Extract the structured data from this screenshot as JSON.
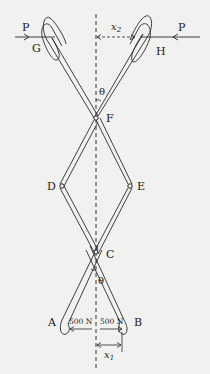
{
  "diagram": {
    "type": "scissor-linkage mechanism",
    "points": {
      "G": "G",
      "H": "H",
      "F": "F",
      "D": "D",
      "E": "E",
      "C": "C",
      "A": "A",
      "B": "B"
    },
    "forces": {
      "left_P": "P",
      "right_P": "P",
      "left_tension": "500 N",
      "right_tension": "500 N"
    },
    "dimensions": {
      "top": "x",
      "top_sub": "2",
      "bottom": "x",
      "bottom_sub": "1"
    },
    "angles": {
      "top": "θ",
      "bottom": "θ"
    },
    "colors": {
      "line": "#2a2a2a",
      "background": "#f1f1ef"
    }
  }
}
